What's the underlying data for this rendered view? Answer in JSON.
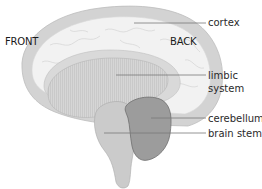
{
  "diagram": {
    "orientation": {
      "front": "FRONT",
      "back": "BACK"
    },
    "labels": [
      {
        "id": "cortex",
        "text": "cortex"
      },
      {
        "id": "limbic",
        "line1": "limbic",
        "line2": "system"
      },
      {
        "id": "cerebellum",
        "text": "cerebellum"
      },
      {
        "id": "brain_stem",
        "text": "brain stem"
      }
    ],
    "colors": {
      "cortex_outer": "#d2d2d2",
      "cortex_inner": "#f1f1f1",
      "limbic": "#cfcfcf",
      "brain_stem": "#c8c8c8",
      "cerebellum": "#9a9a9a",
      "leader_line": "#777777"
    }
  }
}
